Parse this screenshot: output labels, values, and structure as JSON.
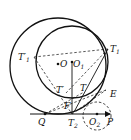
{
  "figure": {
    "labels": {
      "T1": {
        "main": "T",
        "sub": "1"
      },
      "T1prime": {
        "main": "T′",
        "sub": "1"
      },
      "O": {
        "main": "O"
      },
      "O1": {
        "main": "O",
        "sub": "1"
      },
      "Tprime": {
        "main": "T′"
      },
      "T": {
        "main": "T"
      },
      "E": {
        "main": "E"
      },
      "F": {
        "main": "F"
      },
      "Q": {
        "main": "Q"
      },
      "T2": {
        "main": "T",
        "sub": "2"
      },
      "O2": {
        "main": "O",
        "sub": "2"
      },
      "P": {
        "main": "P"
      }
    },
    "colors": {
      "stroke": "#111111",
      "background": "#ffffff"
    }
  }
}
